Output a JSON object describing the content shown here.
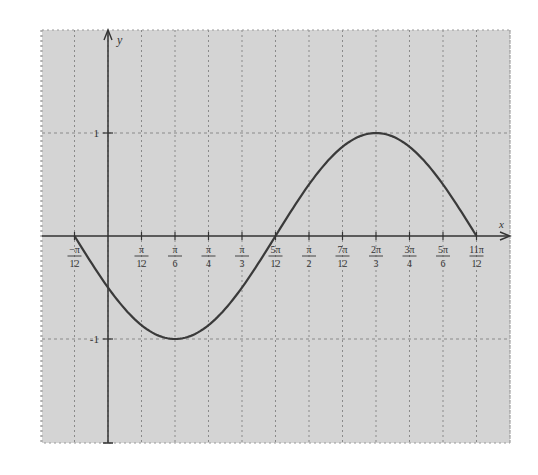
{
  "chart_data": {
    "type": "line",
    "title": "",
    "function": "y = sin(2x - 5π/6)",
    "xlabel": "x",
    "ylabel": "y",
    "x_ticks": [
      {
        "value": -0.2618,
        "num": "−π",
        "den": "12"
      },
      {
        "value": 0.2618,
        "num": "π",
        "den": "12"
      },
      {
        "value": 0.5236,
        "num": "π",
        "den": "6"
      },
      {
        "value": 0.7854,
        "num": "π",
        "den": "4"
      },
      {
        "value": 1.0472,
        "num": "π",
        "den": "3"
      },
      {
        "value": 1.309,
        "num": "5π",
        "den": "12"
      },
      {
        "value": 1.5708,
        "num": "π",
        "den": "2"
      },
      {
        "value": 1.8326,
        "num": "7π",
        "den": "12"
      },
      {
        "value": 2.0944,
        "num": "2π",
        "den": "3"
      },
      {
        "value": 2.3562,
        "num": "3π",
        "den": "4"
      },
      {
        "value": 2.618,
        "num": "5π",
        "den": "6"
      },
      {
        "value": 2.8798,
        "num": "11π",
        "den": "12"
      }
    ],
    "y_ticks": [
      {
        "value": 1,
        "label": "1"
      },
      {
        "value": -1,
        "label": "-1"
      }
    ],
    "xlim": [
      -0.5236,
      3.1416
    ],
    "ylim": [
      -2,
      2
    ],
    "grid": true,
    "grid_style": "dashed",
    "background": "#d4d4d4",
    "line_color": "#3a3a3a",
    "key_points": [
      {
        "x": "-π/12",
        "y": 0
      },
      {
        "x": "0",
        "y": -0.5
      },
      {
        "x": "π/6",
        "y": -1
      },
      {
        "x": "5π/12",
        "y": 0
      },
      {
        "x": "2π/3",
        "y": 1
      },
      {
        "x": "11π/12",
        "y": 0
      }
    ],
    "x_domain_plotted": [
      "-π/12",
      "11π/12"
    ],
    "legend": null
  }
}
